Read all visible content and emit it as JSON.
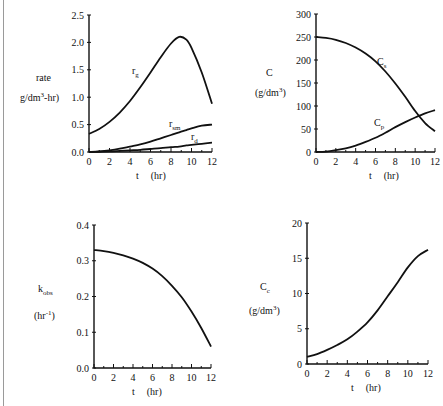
{
  "chart_data": [
    {
      "type": "line",
      "id": "rates",
      "title": "",
      "xlabel": "t     (hr)",
      "ylabel_line1": "rate",
      "ylabel_line2": "g/dm3-hr)",
      "xlim": [
        0,
        12
      ],
      "ylim": [
        0,
        2.5
      ],
      "xticks": [
        0,
        2,
        4,
        6,
        8,
        10,
        12
      ],
      "yticks": [
        "0.0",
        "0.5",
        "1.0",
        "1.5",
        "2.0",
        "2.5"
      ],
      "grid": false,
      "x": [
        0,
        1,
        2,
        3,
        4,
        5,
        6,
        7,
        8,
        8.8,
        9.5,
        10,
        11,
        12
      ],
      "series": [
        {
          "name": "r_g",
          "label": "r",
          "sub": "g",
          "values": [
            0.33,
            0.42,
            0.55,
            0.72,
            0.93,
            1.18,
            1.45,
            1.73,
            1.98,
            2.1,
            2.05,
            1.9,
            1.45,
            0.88
          ]
        },
        {
          "name": "r_sm",
          "label": "r",
          "sub": "sm",
          "values": [
            0.0,
            0.01,
            0.03,
            0.06,
            0.1,
            0.14,
            0.19,
            0.25,
            0.31,
            0.36,
            0.4,
            0.43,
            0.48,
            0.5
          ]
        },
        {
          "name": "r_d",
          "label": "r",
          "sub": "d",
          "values": [
            0.0,
            0.005,
            0.01,
            0.02,
            0.03,
            0.04,
            0.055,
            0.07,
            0.09,
            0.1,
            0.12,
            0.13,
            0.15,
            0.17
          ]
        }
      ]
    },
    {
      "type": "line",
      "id": "concentrations",
      "xlabel": "t     (hr)",
      "ylabel_line1": "C",
      "ylabel_line2": "(g/dm3)",
      "xlim": [
        0,
        12
      ],
      "ylim": [
        0,
        300
      ],
      "xticks": [
        0,
        2,
        4,
        6,
        8,
        10,
        12
      ],
      "yticks": [
        "0",
        "50",
        "100",
        "150",
        "200",
        "250",
        "300"
      ],
      "grid": false,
      "x": [
        0,
        1,
        2,
        3,
        4,
        5,
        6,
        7,
        8,
        9,
        10,
        11,
        12
      ],
      "series": [
        {
          "name": "C_s",
          "label": "C",
          "sub": "s",
          "values": [
            250,
            248,
            244,
            237,
            227,
            214,
            197,
            175,
            149,
            120,
            89,
            63,
            45
          ]
        },
        {
          "name": "C_p",
          "label": "C",
          "sub": "p",
          "values": [
            0,
            1,
            4,
            8,
            14,
            22,
            31,
            42,
            54,
            65,
            75,
            84,
            91
          ]
        }
      ]
    },
    {
      "type": "line",
      "id": "kobs",
      "xlabel": "t     (hr)",
      "ylabel_line1": "kobs",
      "ylabel_line2": "(hr-1)",
      "xlim": [
        0,
        12
      ],
      "ylim": [
        0,
        0.4
      ],
      "xticks": [
        0,
        2,
        4,
        6,
        8,
        10,
        12
      ],
      "yticks": [
        "0.0",
        "0.1",
        "0.2",
        "0.3",
        "0.4"
      ],
      "grid": false,
      "x": [
        0,
        1,
        2,
        3,
        4,
        5,
        6,
        7,
        8,
        9,
        10,
        11,
        12
      ],
      "series": [
        {
          "name": "k_obs",
          "values": [
            0.33,
            0.327,
            0.322,
            0.315,
            0.306,
            0.294,
            0.278,
            0.257,
            0.23,
            0.198,
            0.158,
            0.112,
            0.06
          ]
        }
      ]
    },
    {
      "type": "line",
      "id": "cell_conc",
      "xlabel": "t     (hr)",
      "ylabel_line1": "Cc",
      "ylabel_line2": "(g/dm3)",
      "xlim": [
        0,
        12
      ],
      "ylim": [
        0,
        20
      ],
      "xticks": [
        0,
        2,
        4,
        6,
        8,
        10,
        12
      ],
      "yticks": [
        "0",
        "5",
        "10",
        "15",
        "20"
      ],
      "grid": false,
      "x": [
        0,
        1,
        2,
        3,
        4,
        5,
        6,
        7,
        8,
        9,
        10,
        11,
        12
      ],
      "series": [
        {
          "name": "C_c",
          "values": [
            1.0,
            1.4,
            2.0,
            2.7,
            3.5,
            4.6,
            5.9,
            7.6,
            9.6,
            11.6,
            13.7,
            15.3,
            16.2
          ]
        }
      ]
    }
  ]
}
